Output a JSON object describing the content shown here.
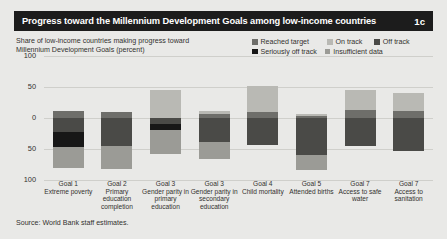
{
  "header": {
    "title": "Progress toward the Millennium Development Goals among low-income countries",
    "figure_number": "1c"
  },
  "subtitle": {
    "line1": "Share of low-income countries making progress toward",
    "line2": "Millennium Development Goals (percent)"
  },
  "source": "Source: World Bank staff estimates.",
  "colors": {
    "background": "#e9e9e7",
    "titlebar": "#1c1c1c",
    "text": "#33322f",
    "gridline": "#cfcfcb",
    "reached_target": "#6e6e6a",
    "on_track": "#b9b9b4",
    "off_track": "#4a4a47",
    "seriously_off_track": "#171717",
    "insufficient_data": "#9b9b96"
  },
  "legend": {
    "items": [
      {
        "label": "Reached target",
        "key": "reached_target",
        "color": "#6e6e6a"
      },
      {
        "label": "On track",
        "key": "on_track",
        "color": "#b9b9b4"
      },
      {
        "label": "Off track",
        "key": "off_track",
        "color": "#4a4a47"
      },
      {
        "label": "Seriously off track",
        "key": "seriously_off_track",
        "color": "#171717"
      },
      {
        "label": "Insufficient data",
        "key": "insufficient_data",
        "color": "#9b9b96"
      }
    ]
  },
  "chart_data": {
    "type": "bar",
    "subtype": "diverging-stacked",
    "title": "Progress toward the Millennium Development Goals among low-income countries",
    "xlabel": "",
    "ylabel": "Share of low-income countries making progress toward Millennium Development Goals (percent)",
    "ylim": [
      -100,
      100
    ],
    "yticks": [
      100,
      50,
      0,
      50,
      100
    ],
    "ytick_labels": [
      "100",
      "50",
      "0",
      "50",
      "100"
    ],
    "grid": true,
    "legend_position": "top-right",
    "categories": [
      {
        "goal": "Goal 1",
        "name": "Extreme poverty"
      },
      {
        "goal": "Goal 2",
        "name": "Primary education completion"
      },
      {
        "goal": "Goal 3",
        "name": "Gender parity in primary education"
      },
      {
        "goal": "Goal 3",
        "name": "Gender parity in secondary education"
      },
      {
        "goal": "Goal 4",
        "name": "Child mortality"
      },
      {
        "goal": "Goal 5",
        "name": "Attended births"
      },
      {
        "goal": "Goal 7",
        "name": "Access to safe water"
      },
      {
        "goal": "Goal 7",
        "name": "Access to sanitation"
      }
    ],
    "series": [
      {
        "name": "Reached target",
        "direction": "up",
        "values": [
          12,
          10,
          0,
          6,
          10,
          4,
          13,
          11
        ]
      },
      {
        "name": "On track",
        "direction": "up",
        "values": [
          0,
          0,
          45,
          5,
          42,
          3,
          32,
          30
        ]
      },
      {
        "name": "Off track",
        "direction": "down",
        "values": [
          22,
          45,
          10,
          39,
          44,
          59,
          45,
          54
        ]
      },
      {
        "name": "Seriously off track",
        "direction": "down",
        "values": [
          24,
          0,
          10,
          0,
          0,
          0,
          0,
          0
        ]
      },
      {
        "name": "Insufficient data",
        "direction": "down",
        "values": [
          35,
          38,
          38,
          27,
          0,
          25,
          0,
          0
        ]
      }
    ]
  }
}
